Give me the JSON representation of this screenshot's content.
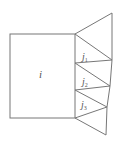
{
  "diagram": {
    "type": "geometric-figure",
    "stroke_color": "#777777",
    "label_color": "#555555",
    "square": {
      "label": "i"
    },
    "triangles": [
      {
        "label": "j",
        "subscript": "1"
      },
      {
        "label": "j",
        "subscript": "2"
      },
      {
        "label": "j",
        "subscript": "3"
      }
    ]
  }
}
